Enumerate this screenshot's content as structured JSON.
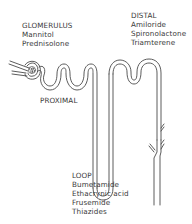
{
  "diagram": {
    "regions": [
      {
        "id": "glomerulus",
        "title": "GLOMERULUS",
        "drugs": [
          "Mannitol",
          "Prednisolone"
        ]
      },
      {
        "id": "distal",
        "title": "DISTAL",
        "drugs": [
          "Amiloride",
          "Spironolactone",
          "Triamterene"
        ]
      },
      {
        "id": "proximal",
        "title": "PROXIMAL",
        "drugs": []
      },
      {
        "id": "loop",
        "title": "LOOP",
        "drugs": [
          "Bumetamide",
          "Ethacrynic acid",
          "Frusemide",
          "Thiazides"
        ]
      }
    ],
    "colors": {
      "line": "#4a4a4a",
      "background": "#ffffff"
    }
  }
}
